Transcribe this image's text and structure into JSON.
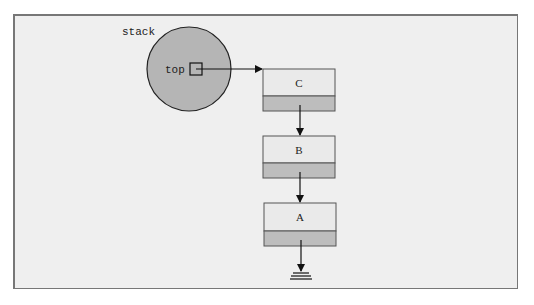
{
  "diagram": {
    "variable_label": "stack",
    "field_label": "top",
    "nodes": [
      {
        "label": "C"
      },
      {
        "label": "B"
      },
      {
        "label": "A"
      }
    ],
    "colors": {
      "background": "#efefef",
      "circle_fill": "#b5b5b5",
      "node_top_fill": "#eaeaea",
      "node_bottom_fill": "#bdbdbd",
      "stroke": "#222222"
    }
  }
}
